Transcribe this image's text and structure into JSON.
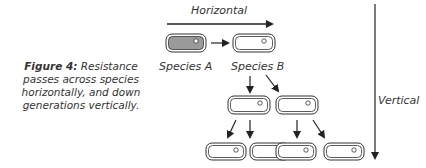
{
  "caption": {
    "prefix": "Figure 4:",
    "text": " Resistance passes across species horizontally, and down generations vertically."
  },
  "labels": {
    "horizontal": "Horizontal",
    "vertical": "Vertical",
    "species_a": "Species A",
    "species_b": "Species B"
  },
  "colors": {
    "species_a_fill": "#9a9a9a",
    "outline": "#333333",
    "arrow": "#222222"
  }
}
